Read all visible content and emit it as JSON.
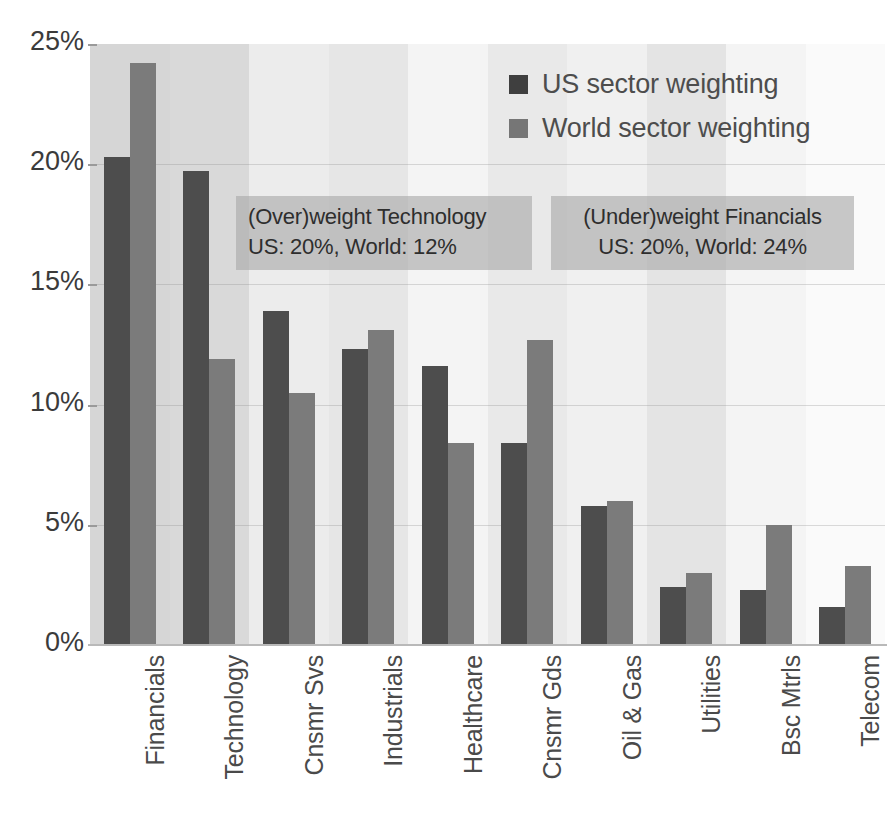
{
  "chart_data": {
    "type": "bar",
    "title": "",
    "subtitle": "",
    "xlabel": "",
    "ylabel": "",
    "ylim": [
      0,
      25
    ],
    "ytick_labels": [
      "0%",
      "5%",
      "10%",
      "15%",
      "20%",
      "25%"
    ],
    "ytick_values": [
      0,
      5,
      10,
      15,
      20,
      25
    ],
    "grid": true,
    "legend_position": "top-right",
    "categories": [
      "Financials",
      "Technology",
      "Cnsmr Svs",
      "Industrials",
      "Healthcare",
      "Cnsmr Gds",
      "Oil & Gas",
      "Utilities",
      "Bsc Mtrls",
      "Telecom"
    ],
    "series": [
      {
        "name": "US sector weighting",
        "color": "#4d4d4d",
        "values": [
          20.3,
          19.7,
          13.9,
          12.3,
          11.6,
          8.4,
          5.8,
          2.4,
          2.3,
          1.6
        ]
      },
      {
        "name": "World sector weighting",
        "color": "#7b7b7b",
        "values": [
          24.2,
          11.9,
          10.5,
          13.1,
          8.4,
          12.7,
          6.0,
          3.0,
          5.0,
          3.3
        ]
      }
    ],
    "annotations": [
      {
        "id": "overweight-technology",
        "lines": [
          "(Over)weight Technology",
          "US: 20%, World: 12%"
        ],
        "align": "left"
      },
      {
        "id": "underweight-financials",
        "lines": [
          "(Under)weight Financials",
          "US: 20%, World: 24%"
        ],
        "align": "center"
      }
    ]
  },
  "legend": {
    "items": [
      {
        "label": "US sector weighting",
        "swatch": "us"
      },
      {
        "label": "World sector weighting",
        "swatch": "world"
      }
    ]
  },
  "axis": {
    "y": {
      "ticks": [
        {
          "label": "25%",
          "value": 25
        },
        {
          "label": "20%",
          "value": 20
        },
        {
          "label": "15%",
          "value": 15
        },
        {
          "label": "10%",
          "value": 10
        },
        {
          "label": "5%",
          "value": 5
        },
        {
          "label": "0%",
          "value": 0
        }
      ]
    },
    "x": {
      "labels": [
        "Financials",
        "Technology",
        "Cnsmr Svs",
        "Industrials",
        "Healthcare",
        "Cnsmr Gds",
        "Oil & Gas",
        "Utilities",
        "Bsc Mtrls",
        "Telecom"
      ]
    }
  },
  "annotations": {
    "technology": {
      "line1": "(Over)weight Technology",
      "line2": "US: 20%, World: 12%"
    },
    "financials": {
      "line1": "(Under)weight Financials",
      "line2": "US: 20%, World: 24%"
    }
  },
  "colors": {
    "us_bar": "#4d4d4d",
    "world_bar": "#7b7b7b",
    "plot_background": "#fbfbfb",
    "band_dark": "#d8d8d8",
    "band_light": "#f2f2f2",
    "callout_background": "#a8a8a8",
    "text": "#3b3b3b"
  }
}
